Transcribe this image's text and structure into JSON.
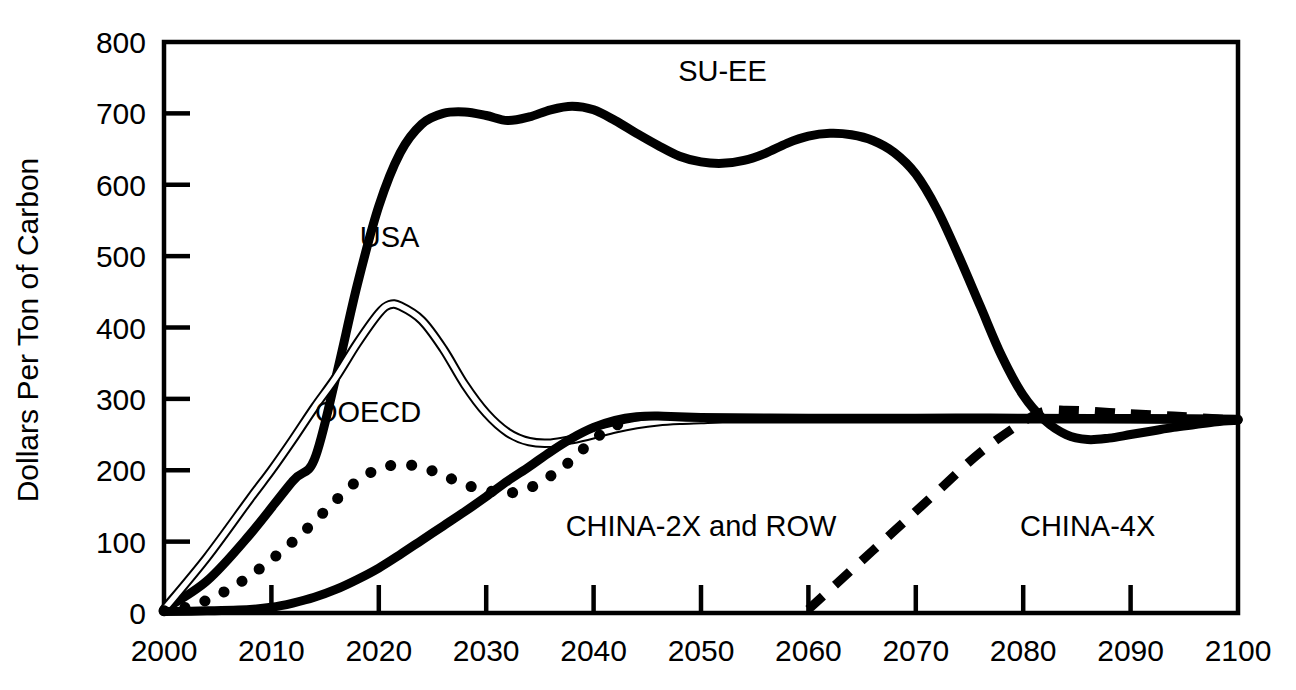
{
  "chart_data": {
    "type": "line",
    "title": "",
    "xlabel": "",
    "ylabel": "Dollars Per Ton of Carbon",
    "xlim": [
      2000,
      2100
    ],
    "ylim": [
      0,
      800
    ],
    "grid": false,
    "legend_position": "inline-annotations",
    "xticks": [
      "2000",
      "2010",
      "2020",
      "2030",
      "2040",
      "2050",
      "2060",
      "2070",
      "2080",
      "2090",
      "2100"
    ],
    "yticks": [
      "0",
      "100",
      "200",
      "300",
      "400",
      "500",
      "600",
      "700",
      "800"
    ],
    "series": [
      {
        "name": "SU-EE",
        "label": "SU-EE",
        "style": "thick-solid",
        "color": "#000000",
        "x": [
          2000,
          2004,
          2008,
          2012,
          2014,
          2016,
          2018,
          2020,
          2022,
          2024,
          2026,
          2028,
          2030,
          2032,
          2034,
          2036,
          2038,
          2040,
          2042,
          2044,
          2046,
          2048,
          2050,
          2052,
          2054,
          2056,
          2058,
          2060,
          2062,
          2064,
          2066,
          2068,
          2070,
          2072,
          2074,
          2076,
          2078,
          2080,
          2082,
          2084,
          2086,
          2088,
          2090,
          2092,
          2094,
          2096,
          2098,
          2100
        ],
        "y": [
          5,
          45,
          110,
          185,
          215,
          330,
          460,
          570,
          645,
          685,
          700,
          702,
          697,
          690,
          695,
          705,
          710,
          705,
          690,
          672,
          655,
          640,
          632,
          630,
          634,
          644,
          658,
          668,
          672,
          670,
          662,
          645,
          615,
          565,
          500,
          430,
          360,
          305,
          270,
          250,
          243,
          245,
          250,
          255,
          260,
          264,
          268,
          270
        ]
      },
      {
        "name": "USA",
        "label": "USA",
        "style": "thin-double",
        "color": "#000000",
        "x": [
          2000,
          2004,
          2008,
          2010,
          2012,
          2014,
          2016,
          2018,
          2020,
          2021,
          2022,
          2024,
          2026,
          2028,
          2030,
          2032,
          2034,
          2036,
          2038,
          2040,
          2042,
          2044,
          2046,
          2048,
          2050,
          2052,
          2056,
          2060,
          2070,
          2080,
          2090,
          2100
        ],
        "y": [
          5,
          78,
          160,
          200,
          243,
          288,
          330,
          378,
          420,
          432,
          430,
          410,
          370,
          320,
          280,
          253,
          240,
          238,
          243,
          250,
          258,
          264,
          268,
          270,
          271,
          272,
          272,
          272,
          272,
          272,
          272,
          271
        ]
      },
      {
        "name": "OOECD",
        "label": "OOECD",
        "style": "dotted",
        "color": "#000000",
        "x": [
          2000,
          2002,
          2004,
          2006,
          2008,
          2010,
          2012,
          2014,
          2016,
          2018,
          2020,
          2022,
          2024,
          2026,
          2028,
          2030,
          2032,
          2034,
          2036,
          2038,
          2040,
          2042,
          2044
        ],
        "y": [
          3,
          8,
          18,
          33,
          52,
          75,
          100,
          128,
          158,
          185,
          202,
          208,
          204,
          193,
          180,
          172,
          168,
          175,
          192,
          215,
          243,
          262,
          273
        ]
      },
      {
        "name": "CHINA-2X and ROW",
        "label": "CHINA-2X and ROW",
        "style": "thick-solid",
        "color": "#000000",
        "x": [
          2000,
          2004,
          2008,
          2010,
          2012,
          2014,
          2016,
          2018,
          2020,
          2022,
          2024,
          2026,
          2028,
          2030,
          2032,
          2034,
          2036,
          2038,
          2040,
          2042,
          2044,
          2046,
          2050,
          2060,
          2070,
          2080,
          2090,
          2100
        ],
        "y": [
          2,
          3,
          5,
          8,
          14,
          22,
          33,
          47,
          63,
          82,
          102,
          122,
          142,
          163,
          185,
          205,
          226,
          245,
          260,
          270,
          275,
          276,
          274,
          273,
          273,
          273,
          272,
          271
        ]
      },
      {
        "name": "CHINA-4X",
        "label": "CHINA-4X",
        "style": "dashed",
        "color": "#000000",
        "x": [
          2060,
          2064,
          2068,
          2072,
          2076,
          2080,
          2082,
          2084,
          2086,
          2088,
          2090,
          2094,
          2098,
          2100
        ],
        "y": [
          5,
          60,
          115,
          170,
          225,
          268,
          283,
          284,
          283,
          281,
          279,
          276,
          272,
          270
        ]
      }
    ],
    "annotations": [
      {
        "text": "SU-EE",
        "x": 2052,
        "y": 745
      },
      {
        "text": "USA",
        "x": 2021,
        "y": 513
      },
      {
        "text": "OOECD",
        "x": 2019,
        "y": 268
      },
      {
        "text": "CHINA-2X and ROW",
        "x": 2050,
        "y": 108
      },
      {
        "text": "CHINA-4X",
        "x": 2086,
        "y": 108
      }
    ]
  }
}
